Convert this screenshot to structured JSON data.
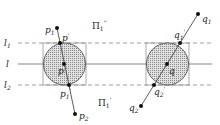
{
  "diagram": {
    "lines": {
      "top": {
        "label": "l",
        "sub": "1"
      },
      "middle": {
        "label": "l",
        "sub": ""
      },
      "bottom": {
        "label": "l",
        "sub": "2"
      }
    },
    "regions": {
      "upper": {
        "label": "Π",
        "sub": "1",
        "sup": "''"
      },
      "lower": {
        "label": "Π",
        "sub": "1",
        "sup": "'"
      }
    },
    "left_figure": {
      "center": {
        "label": "p"
      },
      "endpoint_top": {
        "label": "p",
        "sub": "1"
      },
      "endpoint_bottom": {
        "label": "p",
        "sub": "2"
      },
      "intersect_top": {
        "label": "p",
        "sub": "",
        "sup": "'"
      },
      "intersect_bottom": {
        "label": "p",
        "sub": "1",
        "sup": "'"
      }
    },
    "right_figure": {
      "center": {
        "label": "q"
      },
      "endpoint_top": {
        "label": "q",
        "sub": "1"
      },
      "endpoint_bottom": {
        "label": "q",
        "sub": "2"
      },
      "intersect_top": {
        "label": "q",
        "sub": "1",
        "sup": "'"
      },
      "intersect_bottom": {
        "label": "q",
        "sub": "2",
        "sup": "'"
      }
    },
    "colors": {
      "stroke": "#333333",
      "fill": "#bdbdbd",
      "dash": "#777777"
    }
  }
}
